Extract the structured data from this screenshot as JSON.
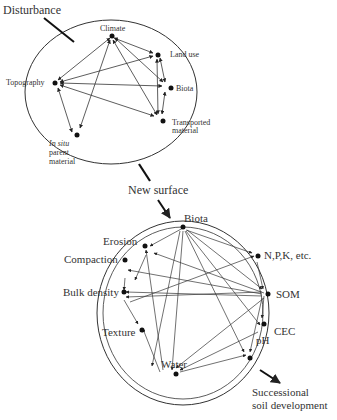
{
  "top_circle": {
    "title": "Disturbance",
    "nodes": [
      {
        "id": "climate",
        "label": "Climate"
      },
      {
        "id": "land_use",
        "label": "Land use"
      },
      {
        "id": "biota",
        "label": "Biota"
      },
      {
        "id": "transported",
        "label": "Transported material"
      },
      {
        "id": "in_situ",
        "label_italic": "In situ",
        "label_rest": "parent material"
      },
      {
        "id": "topography",
        "label": "Topography"
      }
    ]
  },
  "transition_label": "New surface",
  "bottom_circle": {
    "nodes": [
      {
        "id": "biota",
        "label": "Biota"
      },
      {
        "id": "npk",
        "label": "N,P,K, etc."
      },
      {
        "id": "som",
        "label": "SOM"
      },
      {
        "id": "cec",
        "label": "CEC"
      },
      {
        "id": "ph",
        "label": "pH"
      },
      {
        "id": "water",
        "label": "Water"
      },
      {
        "id": "texture",
        "label": "Texture"
      },
      {
        "id": "bulk_density",
        "label": "Bulk density"
      },
      {
        "id": "compaction",
        "label": "Compaction"
      },
      {
        "id": "erosion",
        "label": "Erosion"
      }
    ]
  },
  "outcome_label_line1": "Successional",
  "outcome_label_line2": "soil development"
}
